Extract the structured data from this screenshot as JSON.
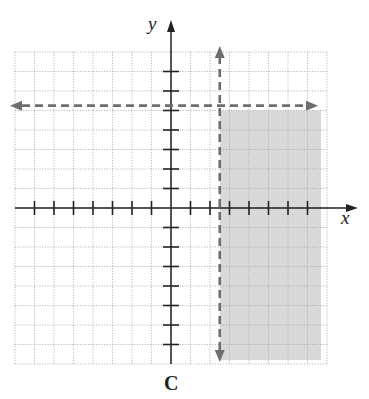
{
  "chart_data": {
    "type": "inequality-graph",
    "title": "",
    "caption": "C",
    "xlabel": "x",
    "ylabel": "y",
    "xlim": [
      -8,
      8
    ],
    "ylim": [
      -8,
      8
    ],
    "grid": true,
    "tick_spacing": 1,
    "boundary_lines": [
      {
        "orientation": "vertical",
        "equation": "x = 2.5",
        "style": "dashed"
      },
      {
        "orientation": "horizontal",
        "equation": "y = 5",
        "style": "dashed"
      }
    ],
    "shaded_region": {
      "description": "x > 2.5 and y < 5",
      "x_range": [
        2.5,
        8
      ],
      "y_range": [
        -8,
        5
      ]
    }
  },
  "colors": {
    "shade": "#d9d9d9",
    "dashed": "#6e6e6e",
    "axis": "#222222",
    "grid": "#a8a8a8"
  },
  "labels": {
    "x_axis": "x",
    "y_axis": "y",
    "caption": "C"
  }
}
